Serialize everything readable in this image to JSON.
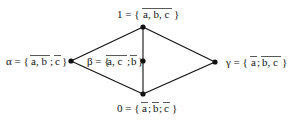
{
  "diagram": {
    "type": "lattice (Hasse diagram)",
    "nodes": [
      {
        "id": "top",
        "x": 143,
        "y": 27,
        "label_prefix": "1 = {",
        "terms": [
          {
            "text": "a, b, c",
            "overline": true
          }
        ],
        "label_suffix": "}"
      },
      {
        "id": "alpha",
        "x": 71,
        "y": 61,
        "label_prefix": "α = {",
        "terms": [
          {
            "text": "a, b",
            "overline": true
          },
          {
            "text": "; ",
            "overline": false
          },
          {
            "text": "c",
            "overline": true
          }
        ],
        "label_suffix": "}"
      },
      {
        "id": "beta",
        "x": 143,
        "y": 61,
        "label_prefix": "β = {",
        "terms": [
          {
            "text": "a, c",
            "overline": true
          },
          {
            "text": "; ",
            "overline": false
          },
          {
            "text": "b",
            "overline": true
          }
        ],
        "label_suffix": "}"
      },
      {
        "id": "gamma",
        "x": 215,
        "y": 62,
        "label_prefix": "γ = {",
        "terms": [
          {
            "text": "a",
            "overline": true
          },
          {
            "text": "; ",
            "overline": false
          },
          {
            "text": "b, c",
            "overline": true
          }
        ],
        "label_suffix": "}"
      },
      {
        "id": "bottom",
        "x": 143,
        "y": 94,
        "label_prefix": "0 = {",
        "terms": [
          {
            "text": "a",
            "overline": true
          },
          {
            "text": "; ",
            "overline": false
          },
          {
            "text": "b",
            "overline": true
          },
          {
            "text": "; ",
            "overline": false
          },
          {
            "text": "c",
            "overline": true
          }
        ],
        "label_suffix": "}"
      }
    ],
    "edges": [
      [
        "top",
        "alpha"
      ],
      [
        "top",
        "beta"
      ],
      [
        "top",
        "gamma"
      ],
      [
        "alpha",
        "bottom"
      ],
      [
        "beta",
        "bottom"
      ],
      [
        "gamma",
        "bottom"
      ]
    ],
    "labels": {
      "top": "1 = { a, b, c }",
      "alpha": "α = { a, b; c }",
      "beta": "β = { a, c; b }",
      "gamma": "γ = { a; b, c }",
      "bottom": "0 = { a; b; c }"
    }
  }
}
